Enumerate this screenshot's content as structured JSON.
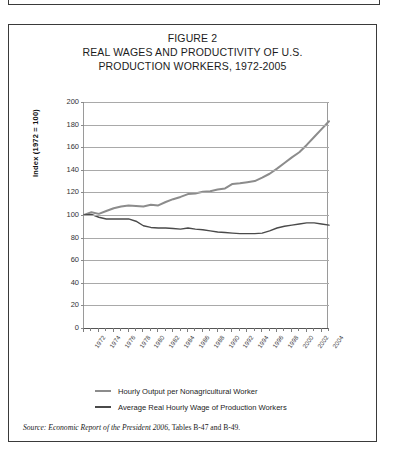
{
  "figure": {
    "title_lines": [
      "FIGURE 2",
      "REAL WAGES AND PRODUCTIVITY OF U.S.",
      "PRODUCTION WORKERS, 1972-2005"
    ],
    "source_prefix": "Source:",
    "source_italic": "Economic Report of the President 2006",
    "source_rest": ", Tables B-47 and B-49."
  },
  "colors": {
    "productivity_line": "#8c8c8c",
    "wage_line": "#4a4a4a",
    "grid": "#a9a9a9",
    "axis": "#555555",
    "border": "#3a3a3a",
    "text": "#1c1c1c"
  },
  "chart_data": {
    "type": "line",
    "title": "REAL WAGES AND PRODUCTIVITY OF U.S. PRODUCTION WORKERS, 1972-2005",
    "xlabel": "",
    "ylabel": "Index (1972 = 100)",
    "ylim": [
      0,
      200
    ],
    "ytick_values": [
      0,
      20,
      40,
      60,
      80,
      100,
      120,
      140,
      160,
      180,
      200
    ],
    "ytick_labels": [
      "0",
      "20",
      "40",
      "60",
      "80",
      "100",
      "120",
      "140",
      "160",
      "180",
      "200"
    ],
    "xlim": [
      1972,
      2005
    ],
    "x": [
      1972,
      1973,
      1974,
      1975,
      1976,
      1977,
      1978,
      1979,
      1980,
      1981,
      1982,
      1983,
      1984,
      1985,
      1986,
      1987,
      1988,
      1989,
      1990,
      1991,
      1992,
      1993,
      1994,
      1995,
      1996,
      1997,
      1998,
      1999,
      2000,
      2001,
      2002,
      2003,
      2004,
      2005
    ],
    "xtick_labels": [
      "1972",
      "1974",
      "1976",
      "1978",
      "1980",
      "1982",
      "1984",
      "1986",
      "1988",
      "1990",
      "1992",
      "1994",
      "1996",
      "1998",
      "2000",
      "2002",
      "2004"
    ],
    "xtick_label_interval": 2,
    "grid": true,
    "legend_position": "below",
    "series": [
      {
        "name": "Hourly Output per Nonagricultural Worker",
        "color": "#8c8c8c",
        "values": [
          100.0,
          102.5,
          101.0,
          103.5,
          106.0,
          107.5,
          108.5,
          108.0,
          107.5,
          109.0,
          108.5,
          111.5,
          114.0,
          116.0,
          118.5,
          119.0,
          120.5,
          121.0,
          122.5,
          123.5,
          127.5,
          128.0,
          129.0,
          130.0,
          133.0,
          136.5,
          141.0,
          146.0,
          151.0,
          155.5,
          162.0,
          169.0,
          176.0,
          183.0
        ]
      },
      {
        "name": "Average Real Hourly Wage of Production Workers",
        "color": "#4a4a4a",
        "values": [
          100.0,
          100.5,
          98.0,
          96.5,
          96.5,
          96.5,
          96.5,
          94.5,
          90.5,
          89.0,
          88.5,
          88.5,
          88.0,
          87.5,
          88.5,
          87.5,
          87.0,
          86.0,
          85.0,
          84.5,
          84.0,
          83.5,
          83.5,
          83.5,
          84.0,
          86.0,
          88.5,
          90.0,
          91.0,
          92.0,
          93.0,
          93.0,
          92.0,
          91.0
        ]
      }
    ]
  }
}
